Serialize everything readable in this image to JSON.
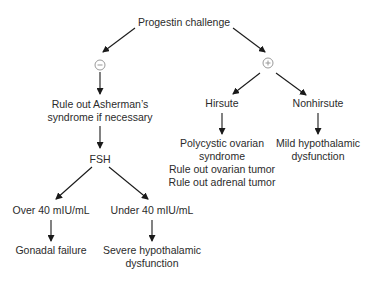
{
  "diagram": {
    "type": "flowchart",
    "root": {
      "label": "Progestin challenge"
    },
    "symbols": {
      "negative": {
        "label": "minus",
        "glyph": "⊖"
      },
      "positive": {
        "label": "plus",
        "glyph": "⊕"
      }
    },
    "negative_branch": {
      "step1": {
        "lines": [
          "Rule out Asherman’s",
          "syndrome if necessary"
        ]
      },
      "step2": {
        "label": "FSH"
      },
      "over": {
        "label": "Over 40 mIU/mL",
        "result": {
          "lines": [
            "Gonadal failure"
          ]
        }
      },
      "under": {
        "label": "Under 40 mIU/mL",
        "result": {
          "lines": [
            "Severe hypothalamic",
            "dysfunction"
          ]
        }
      }
    },
    "positive_branch": {
      "hirsute": {
        "label": "Hirsute",
        "result": {
          "lines": [
            "Polycystic ovarian",
            "syndrome",
            "Rule out ovarian tumor",
            "Rule out adrenal tumor"
          ]
        }
      },
      "nonhirsute": {
        "label": "Nonhirsute",
        "result": {
          "lines": [
            "Mild hypothalamic",
            "dysfunction"
          ]
        }
      }
    },
    "colors": {
      "text": "#2b2b2b",
      "arrow": "#1a1a1a",
      "symbol": "#9a9a9a",
      "background": "#ffffff"
    }
  }
}
